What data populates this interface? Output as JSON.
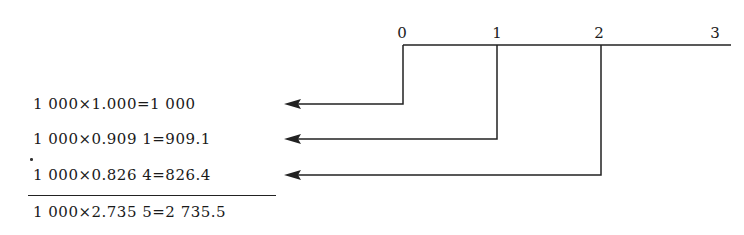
{
  "timeline": {
    "periods": [
      {
        "label": "0",
        "x": 403
      },
      {
        "label": "1",
        "x": 497
      },
      {
        "label": "2",
        "x": 601
      },
      {
        "label": "3",
        "x": 727
      }
    ],
    "line_y": 45,
    "line_start_x": 403,
    "line_end_x": 731
  },
  "equations": [
    {
      "text": "1 000×1.000=1 000",
      "y": 95,
      "from_period": "0",
      "arrow_y": 104
    },
    {
      "text": "1 000×0.909 1=909.1",
      "y": 130,
      "from_period": "1",
      "arrow_y": 139
    },
    {
      "text": "1 000×0.826 4=826.4",
      "y": 166,
      "from_period": "2",
      "arrow_y": 175
    }
  ],
  "total": {
    "text": "1 000×2.735 5=2 735.5",
    "y": 203
  },
  "colors": {
    "line": "#222222",
    "text": "#1a1a1a",
    "background": "#ffffff"
  }
}
